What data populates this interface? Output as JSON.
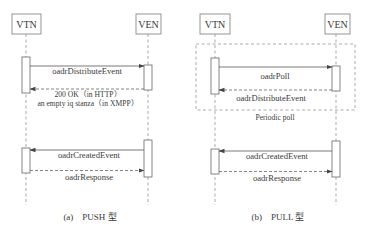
{
  "panels": [
    {
      "id": "a",
      "caption": "(a)　PUSH 型",
      "actors": {
        "left": "VTN",
        "right": "VEN"
      },
      "messages": [
        {
          "label": "oadrDistributeEvent",
          "direction": "VTN->VEN",
          "style": "solid"
        },
        {
          "label": "200 OK（in HTTP）",
          "label2": "an empty iq stanza（in XMPP）",
          "direction": "VEN->VTN",
          "style": "dashed"
        },
        {
          "label": "oadrCreatedEvent",
          "direction": "VEN->VTN",
          "style": "solid"
        },
        {
          "label": "oadrResponse",
          "direction": "VTN->VEN",
          "style": "dashed"
        }
      ]
    },
    {
      "id": "b",
      "caption": "(b)　PULL 型",
      "actors": {
        "left": "VTN",
        "right": "VEN"
      },
      "frame_label": "Periodic poll",
      "messages": [
        {
          "label": "oadrPoll",
          "direction": "VTN->VEN",
          "style": "solid"
        },
        {
          "label": "oadrDistributeEvent",
          "direction": "VEN->VTN",
          "style": "dashed"
        },
        {
          "label": "oadrCreatedEvent",
          "direction": "VEN->VTN",
          "style": "solid"
        },
        {
          "label": "oadrResponse",
          "direction": "VTN->VEN",
          "style": "dashed"
        }
      ]
    }
  ],
  "colors": {
    "line": "#555555",
    "dashed": "#777777",
    "box_border": "#7a7a7a",
    "text": "#3a3a3a"
  }
}
